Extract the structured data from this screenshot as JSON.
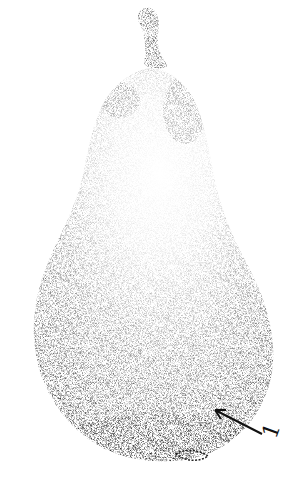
{
  "figure": {
    "background_color": "#ffffff",
    "ink_color": "#111111",
    "annotation": {
      "label": "1",
      "arrow_from": [
        262,
        434
      ],
      "arrow_to": [
        215,
        410
      ]
    }
  }
}
